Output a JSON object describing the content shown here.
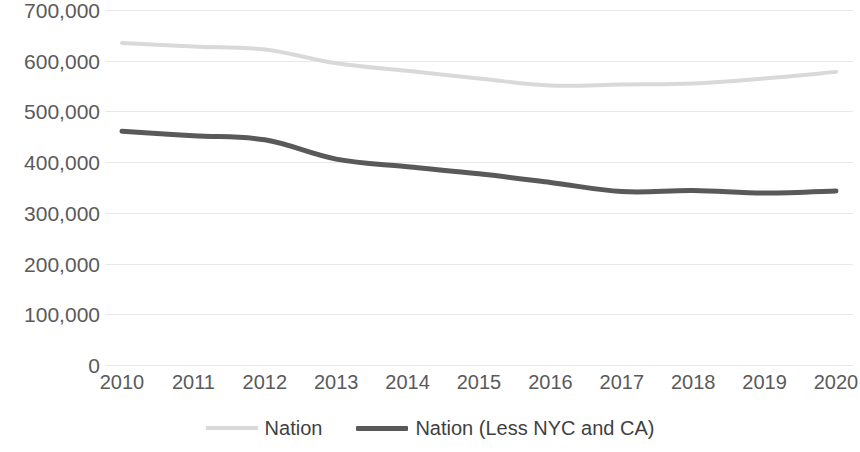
{
  "chart_data": {
    "type": "line",
    "title": "",
    "subtitle": "",
    "xlabel": "",
    "ylabel": "",
    "categories": [
      "2010",
      "2011",
      "2012",
      "2013",
      "2014",
      "2015",
      "2016",
      "2017",
      "2018",
      "2019",
      "2020"
    ],
    "ylim": [
      0,
      700000
    ],
    "ytick_values": [
      700000,
      600000,
      500000,
      400000,
      300000,
      200000,
      100000,
      0
    ],
    "ytick_labels": [
      "700,000",
      "600,000",
      "500,000",
      "400,000",
      "300,000",
      "200,000",
      "100,000",
      "0"
    ],
    "grid": true,
    "grid_axis": "y",
    "legend_position": "bottom",
    "series": [
      {
        "name": "Nation",
        "color": "#d9d9d9",
        "width": 4,
        "values": [
          635000,
          628000,
          622000,
          595000,
          580000,
          565000,
          551000,
          553000,
          555000,
          565000,
          578000
        ]
      },
      {
        "name": "Nation (Less NYC and CA)",
        "color": "#595959",
        "width": 5,
        "values": [
          461000,
          452000,
          444000,
          406000,
          391000,
          377000,
          360000,
          342000,
          344000,
          339000,
          343000
        ]
      }
    ]
  },
  "legend": {
    "items": [
      {
        "label": "Nation",
        "color": "#d9d9d9"
      },
      {
        "label": "Nation (Less NYC and CA)",
        "color": "#595959"
      }
    ]
  }
}
